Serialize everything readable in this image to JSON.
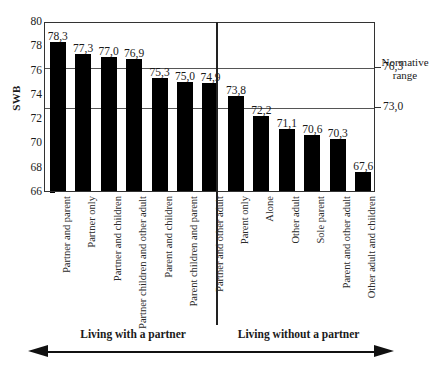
{
  "chart_data": {
    "type": "bar",
    "title": "",
    "xlabel": "",
    "ylabel": "SWB",
    "ylim": [
      66,
      80
    ],
    "ytick_values": [
      80,
      78,
      76,
      74,
      72,
      70,
      68,
      66
    ],
    "grid": false,
    "decimal_separator": ",",
    "categories": [
      "Partner and parent",
      "Partner only",
      "Partner and children",
      "Partner children and other adult",
      "Parent and children",
      "Parent children and parent",
      "Partner and other adult",
      "Parent only",
      "Alone",
      "Other adult",
      "Sole parent",
      "Parent and other adult",
      "Other adult and children"
    ],
    "values": [
      78.3,
      77.3,
      77.0,
      76.9,
      75.3,
      75.0,
      74.9,
      73.8,
      72.2,
      71.1,
      70.6,
      70.3,
      67.6
    ],
    "value_labels": [
      "78,3",
      "77,3",
      "77,0",
      "76,9",
      "75,3",
      "75,0",
      "74,9",
      "73,8",
      "72,2",
      "71,1",
      "70,6",
      "70,3",
      "67,6"
    ],
    "bar_color": "#000000",
    "annotations": {
      "normative_range": {
        "caption": "Normative range",
        "caption_line1": "Normative",
        "caption_line2": "range",
        "upper_label": "76,3",
        "lower_label": "73,0",
        "upper_value": 76.3,
        "lower_value": 73.0
      }
    },
    "groups": [
      {
        "label": "Living with a partner",
        "count": 7
      },
      {
        "label": "Living without a partner",
        "count": 6
      }
    ]
  }
}
